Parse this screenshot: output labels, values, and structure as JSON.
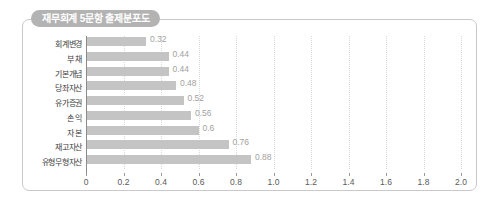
{
  "panel": {
    "title": "재무회계 5문항 출제분포도"
  },
  "chart_data": {
    "type": "bar",
    "orientation": "horizontal",
    "title": "재무회계 5문항 출제분포도",
    "xlabel": "",
    "ylabel": "",
    "xlim": [
      0,
      2.0
    ],
    "xticks": [
      "0",
      "0.2",
      "0.4",
      "0.6",
      "0.8",
      "1.0",
      "1.2",
      "1.4",
      "1.6",
      "1.8",
      "2.0"
    ],
    "xtick_values": [
      0,
      0.2,
      0.4,
      0.6,
      0.8,
      1.0,
      1.2,
      1.4,
      1.6,
      1.8,
      2.0
    ],
    "grid": true,
    "legend": false,
    "bar_color": "#c4c4c4",
    "value_label_color": "#a2a2a2",
    "categories": [
      "회계변경",
      "부 채",
      "기본개념",
      "당좌자산",
      "유가증권",
      "손 익",
      "자 본",
      "재고자산",
      "유형무형자산"
    ],
    "values": [
      0.32,
      0.44,
      0.44,
      0.48,
      0.52,
      0.56,
      0.6,
      0.76,
      0.88
    ],
    "value_labels": [
      "0.32",
      "0.44",
      "0.44",
      "0.48",
      "0.52",
      "0.56",
      "0.6",
      "0.76",
      "0.88"
    ]
  }
}
